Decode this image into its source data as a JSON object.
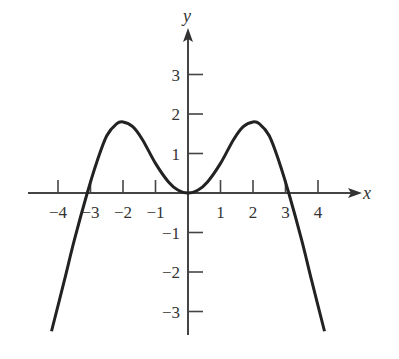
{
  "chart_data": {
    "type": "line",
    "title": "",
    "xlabel": "x",
    "ylabel": "y",
    "xlim": [
      -4.2,
      4.2
    ],
    "ylim": [
      -3.5,
      4
    ],
    "grid": false,
    "x_ticks": [
      -4,
      -3,
      -2,
      -1,
      1,
      2,
      3,
      4
    ],
    "x_tick_labels": [
      "−4",
      "−3",
      "−2",
      "−1",
      "1",
      "2",
      "3",
      "4"
    ],
    "y_ticks": [
      -3,
      -2,
      -1,
      1,
      2,
      3
    ],
    "y_tick_labels": [
      "−3",
      "−2",
      "−1",
      "1",
      "2",
      "3"
    ],
    "series": [
      {
        "name": "f(x)",
        "x": [
          -4.2,
          -3.8,
          -3.5,
          -3.1,
          -2.8,
          -2.5,
          -2.2,
          -2.0,
          -1.7,
          -1.4,
          -1.0,
          -0.6,
          -0.3,
          0,
          0.3,
          0.6,
          1.0,
          1.4,
          1.7,
          2.0,
          2.2,
          2.5,
          2.8,
          3.1,
          3.5,
          3.8,
          4.2
        ],
        "y": [
          -3.5,
          -2.2,
          -1.2,
          0.0,
          0.8,
          1.45,
          1.75,
          1.8,
          1.68,
          1.35,
          0.75,
          0.28,
          0.07,
          0,
          0.07,
          0.28,
          0.75,
          1.35,
          1.68,
          1.8,
          1.75,
          1.45,
          0.8,
          0.0,
          -1.2,
          -2.2,
          -3.5
        ]
      }
    ]
  }
}
